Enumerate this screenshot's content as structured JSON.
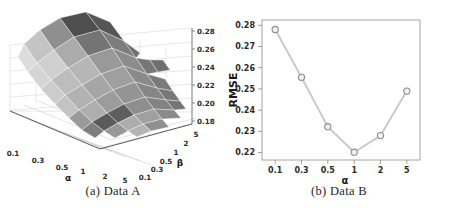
{
  "figure": {
    "panels": [
      {
        "id": "a",
        "caption": "(a) Data A"
      },
      {
        "id": "b",
        "caption": "(b) Data B"
      }
    ]
  },
  "chart_data": [
    {
      "type": "surface",
      "title": "",
      "caption": "(a) Data A",
      "xlabel": "α",
      "ylabel": "β",
      "zlabel": "",
      "xticklabels": [
        "0.1",
        "0.3",
        "0.5",
        "1",
        "2",
        "5"
      ],
      "yticklabels": [
        "0.1",
        "0.3",
        "0.5",
        "1",
        "2",
        "5"
      ],
      "zticklabels": [
        "0.18",
        "0.20",
        "0.22",
        "0.24",
        "0.26",
        "0.28"
      ],
      "zlim": [
        0.18,
        0.28
      ],
      "grid": true,
      "colormap": "grayscale",
      "x": [
        0.1,
        0.3,
        0.5,
        1,
        2,
        5
      ],
      "y": [
        0.1,
        0.3,
        0.5,
        1,
        2,
        5
      ],
      "z": [
        [
          0.281,
          0.266,
          0.251,
          0.239,
          0.244,
          0.262
        ],
        [
          0.262,
          0.247,
          0.233,
          0.224,
          0.229,
          0.247
        ],
        [
          0.249,
          0.234,
          0.222,
          0.214,
          0.22,
          0.238
        ],
        [
          0.238,
          0.223,
          0.212,
          0.205,
          0.212,
          0.231
        ],
        [
          0.243,
          0.228,
          0.217,
          0.211,
          0.218,
          0.236
        ],
        [
          0.261,
          0.246,
          0.235,
          0.229,
          0.236,
          0.254
        ]
      ]
    },
    {
      "type": "line",
      "title": "",
      "caption": "(b) Data B",
      "xlabel": "α",
      "ylabel": "RMSE",
      "categories": [
        "0.1",
        "0.3",
        "0.5",
        "1",
        "2",
        "5"
      ],
      "values": [
        0.278,
        0.2555,
        0.2322,
        0.2202,
        0.228,
        0.249
      ],
      "yticklabels": [
        "0.22",
        "0.23",
        "0.24",
        "0.25",
        "0.26",
        "0.27",
        "0.28"
      ],
      "ylim": [
        0.2165,
        0.2825
      ],
      "grid": false,
      "marker": "open-circle",
      "line_color": "#c9c9c9",
      "marker_color": "#8d8d8d"
    }
  ]
}
